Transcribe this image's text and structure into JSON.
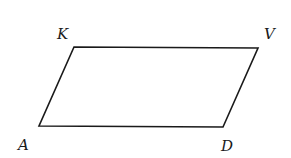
{
  "figure": {
    "shape": "parallelogram",
    "stroke_color": "#1a1a1a",
    "vertices": {
      "K": {
        "label": "K",
        "x": 74,
        "y": 47
      },
      "V": {
        "label": "V",
        "x": 258,
        "y": 48
      },
      "D": {
        "label": "D",
        "x": 223,
        "y": 127
      },
      "A": {
        "label": "A",
        "x": 39,
        "y": 126
      }
    },
    "labels": {
      "K": {
        "text": "K",
        "x": 57,
        "y": 39
      },
      "V": {
        "text": "V",
        "x": 264,
        "y": 39
      },
      "A": {
        "text": "A",
        "x": 18,
        "y": 150
      },
      "D": {
        "text": "D",
        "x": 221,
        "y": 151
      }
    }
  }
}
